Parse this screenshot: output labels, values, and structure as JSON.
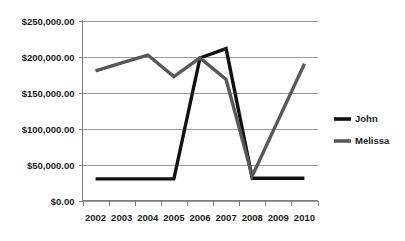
{
  "chart_data": {
    "type": "line",
    "title": "",
    "subtitle": "",
    "xlabel": "",
    "ylabel": "",
    "categories": [
      "2002",
      "2003",
      "2004",
      "2005",
      "2006",
      "2007",
      "2008",
      "2009",
      "2010"
    ],
    "ylim": [
      0,
      250000
    ],
    "ytick_values": [
      0,
      50000,
      100000,
      150000,
      200000,
      250000
    ],
    "ytick_labels": [
      "$0.00",
      "$50,000.00",
      "$100,000.00",
      "$150,000.00",
      "$200,000.00",
      "$250,000.00"
    ],
    "grid": true,
    "grid_axis": "y",
    "legend_position": "right",
    "series": [
      {
        "name": "John",
        "color": "#111111",
        "values": [
          30000,
          30000,
          30000,
          30000,
          198000,
          211000,
          31000,
          31000,
          31000
        ]
      },
      {
        "name": "Melissa",
        "color": "#585858",
        "values": [
          180000,
          191000,
          202000,
          172000,
          198000,
          168000,
          34000,
          112000,
          190000
        ]
      }
    ]
  },
  "legend": {
    "entries": [
      {
        "label": "John",
        "color": "#111111"
      },
      {
        "label": "Melissa",
        "color": "#585858"
      }
    ]
  },
  "colors": {
    "background": "#ffffff",
    "gridline": "#9a9a9a",
    "axis": "#7d7d7d",
    "text": "#1a1a1a",
    "series_john": "#111111",
    "series_melissa": "#585858"
  }
}
